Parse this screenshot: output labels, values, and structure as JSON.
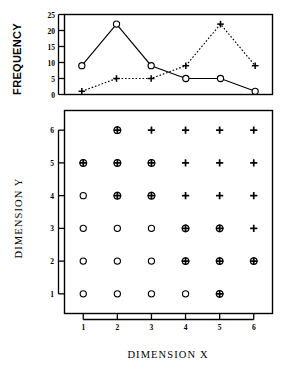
{
  "figure": {
    "background": "#ffffff",
    "ink": "#000000"
  },
  "chart_data": [
    {
      "id": "frequency-line-chart",
      "type": "line",
      "title": "",
      "xlabel": "",
      "ylabel": "FREQUENCY",
      "x": [
        1,
        2,
        3,
        4,
        5,
        6
      ],
      "xlim": [
        0.5,
        6.5
      ],
      "ylim": [
        0,
        25
      ],
      "yticks": [
        0,
        5,
        10,
        15,
        20,
        25
      ],
      "ytick_labels": [
        "0",
        "5",
        "10",
        "15",
        "20",
        "25"
      ],
      "xticks": [],
      "xtick_labels": [],
      "grid": false,
      "legend": "none",
      "series": [
        {
          "name": "circle-series",
          "marker": "circle",
          "linestyle": "solid",
          "color": "#000000",
          "values": [
            9,
            22,
            9,
            5,
            5,
            1
          ]
        },
        {
          "name": "plus-series",
          "marker": "plus",
          "linestyle": "dotted",
          "color": "#000000",
          "values": [
            1,
            5,
            5,
            9,
            22,
            9
          ]
        }
      ]
    },
    {
      "id": "dimension-scatter-grid",
      "type": "scatter",
      "title": "",
      "xlabel": "DIMENSION X",
      "ylabel": "DIMENSION Y",
      "xlim": [
        0.45,
        6.55
      ],
      "ylim": [
        0.4,
        6.6
      ],
      "xticks": [
        1,
        2,
        3,
        4,
        5,
        6
      ],
      "xtick_labels": [
        "1",
        "2",
        "3",
        "4",
        "5",
        "6"
      ],
      "yticks": [
        1,
        2,
        3,
        4,
        5,
        6
      ],
      "ytick_labels": [
        "1",
        "2",
        "3",
        "4",
        "5",
        "6"
      ],
      "grid": false,
      "legend": "none",
      "marker_types": [
        "circle",
        "circled-plus",
        "plus",
        "none"
      ],
      "cells": [
        {
          "x": 1,
          "y": 6,
          "marker": "none"
        },
        {
          "x": 2,
          "y": 6,
          "marker": "circled-plus"
        },
        {
          "x": 3,
          "y": 6,
          "marker": "plus"
        },
        {
          "x": 4,
          "y": 6,
          "marker": "plus"
        },
        {
          "x": 5,
          "y": 6,
          "marker": "plus"
        },
        {
          "x": 6,
          "y": 6,
          "marker": "plus"
        },
        {
          "x": 1,
          "y": 5,
          "marker": "circled-plus"
        },
        {
          "x": 2,
          "y": 5,
          "marker": "circled-plus"
        },
        {
          "x": 3,
          "y": 5,
          "marker": "circled-plus"
        },
        {
          "x": 4,
          "y": 5,
          "marker": "plus"
        },
        {
          "x": 5,
          "y": 5,
          "marker": "plus"
        },
        {
          "x": 6,
          "y": 5,
          "marker": "plus"
        },
        {
          "x": 1,
          "y": 4,
          "marker": "circle"
        },
        {
          "x": 2,
          "y": 4,
          "marker": "circled-plus"
        },
        {
          "x": 3,
          "y": 4,
          "marker": "circled-plus"
        },
        {
          "x": 4,
          "y": 4,
          "marker": "plus"
        },
        {
          "x": 5,
          "y": 4,
          "marker": "plus"
        },
        {
          "x": 6,
          "y": 4,
          "marker": "plus"
        },
        {
          "x": 1,
          "y": 3,
          "marker": "circle"
        },
        {
          "x": 2,
          "y": 3,
          "marker": "circle"
        },
        {
          "x": 3,
          "y": 3,
          "marker": "circle"
        },
        {
          "x": 4,
          "y": 3,
          "marker": "circled-plus"
        },
        {
          "x": 5,
          "y": 3,
          "marker": "circled-plus"
        },
        {
          "x": 6,
          "y": 3,
          "marker": "plus"
        },
        {
          "x": 1,
          "y": 2,
          "marker": "circle"
        },
        {
          "x": 2,
          "y": 2,
          "marker": "circle"
        },
        {
          "x": 3,
          "y": 2,
          "marker": "circle"
        },
        {
          "x": 4,
          "y": 2,
          "marker": "circled-plus"
        },
        {
          "x": 5,
          "y": 2,
          "marker": "circled-plus"
        },
        {
          "x": 6,
          "y": 2,
          "marker": "circled-plus"
        },
        {
          "x": 1,
          "y": 1,
          "marker": "circle"
        },
        {
          "x": 2,
          "y": 1,
          "marker": "circle"
        },
        {
          "x": 3,
          "y": 1,
          "marker": "circle"
        },
        {
          "x": 4,
          "y": 1,
          "marker": "circle"
        },
        {
          "x": 5,
          "y": 1,
          "marker": "circled-plus"
        },
        {
          "x": 6,
          "y": 1,
          "marker": "none"
        }
      ]
    }
  ]
}
